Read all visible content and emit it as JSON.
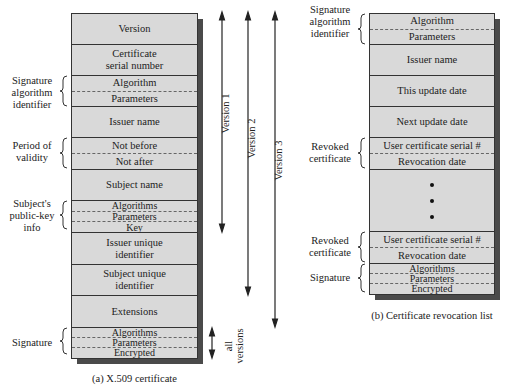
{
  "x509": {
    "caption": "(a) X.509 certificate",
    "fields": [
      {
        "parts": [
          "Version"
        ]
      },
      {
        "parts": [
          "Certificate\nserial number"
        ]
      },
      {
        "parts": [
          "Algorithm",
          "Parameters"
        ]
      },
      {
        "parts": [
          "Issuer name"
        ]
      },
      {
        "parts": [
          "Not before",
          "Not after"
        ]
      },
      {
        "parts": [
          "Subject name"
        ]
      },
      {
        "parts": [
          "Algorithms",
          "Parameters",
          "Key"
        ]
      },
      {
        "parts": [
          "Issuer unique\nidentifier"
        ]
      },
      {
        "parts": [
          "Subject unique\nidentifier"
        ]
      },
      {
        "parts": [
          "Extensions"
        ]
      },
      {
        "parts": [
          "Algorithms",
          "Parameters",
          "Encrypted"
        ]
      }
    ],
    "group_labels": {
      "sig_alg": "Signature\nalgorithm\nidentifier",
      "validity": "Period of\nvalidity",
      "pubkey": "Subject's\npublic-key\ninfo",
      "signature": "Signature"
    },
    "version_arrows": {
      "v1": "Version 1",
      "v2": "Version 2",
      "v3": "Version 3",
      "all": "all\nversions"
    }
  },
  "crl": {
    "caption": "(b) Certificate revocation list",
    "fields": [
      {
        "parts": [
          "Algorithm",
          "Parameters"
        ]
      },
      {
        "parts": [
          "Issuer name"
        ]
      },
      {
        "parts": [
          "This update date"
        ]
      },
      {
        "parts": [
          "Next update date"
        ]
      },
      {
        "parts": [
          "User certificate serial #",
          "Revocation date"
        ]
      },
      {
        "parts": [
          "•",
          "•",
          "•"
        ]
      },
      {
        "parts": [
          "User certificate serial #",
          "Revocation date"
        ]
      },
      {
        "parts": [
          "Algorithms",
          "Parameters",
          "Encrypted"
        ]
      }
    ],
    "group_labels": {
      "sig_alg": "Signature\nalgorithm\nidentifier",
      "revoked1": "Revoked\ncertificate",
      "revoked2": "Revoked\ncertificate",
      "signature": "Signature"
    }
  }
}
